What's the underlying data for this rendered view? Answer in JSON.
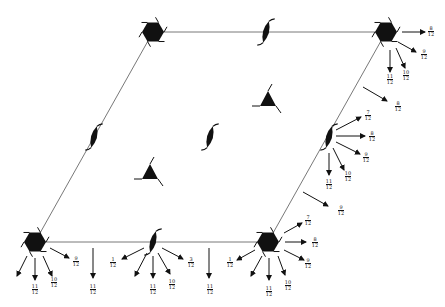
{
  "diagram": {
    "type": "space-group symmetry diagram",
    "cell": {
      "corners": [
        [
          153,
          32
        ],
        [
          386,
          32
        ],
        [
          268,
          242
        ],
        [
          35,
          242
        ]
      ],
      "line_color": "#555555"
    },
    "sixfold_axes": [
      {
        "id": "top-left",
        "x": 153,
        "y": 32
      },
      {
        "id": "top-right",
        "x": 386,
        "y": 32
      },
      {
        "id": "bottom-left",
        "x": 35,
        "y": 242
      },
      {
        "id": "bottom-right",
        "x": 268,
        "y": 242
      }
    ],
    "twofold_axes": [
      {
        "id": "top-edge",
        "x": 266,
        "y": 32
      },
      {
        "id": "left-edge",
        "x": 94,
        "y": 137
      },
      {
        "id": "center",
        "x": 210,
        "y": 137
      },
      {
        "id": "right-edge",
        "x": 329,
        "y": 137
      },
      {
        "id": "bottom-edge",
        "x": 153,
        "y": 242
      }
    ],
    "threefold_axes": [
      {
        "id": "upper",
        "x": 268,
        "y": 100
      },
      {
        "id": "lower",
        "x": 150,
        "y": 173
      }
    ],
    "arrows": [
      {
        "x1": 402,
        "y1": 32,
        "x2": 425,
        "y2": 32,
        "label": {
          "num": "8",
          "den": "12"
        },
        "lx": 431,
        "ly": 32
      },
      {
        "x1": 398,
        "y1": 42,
        "x2": 416,
        "y2": 52,
        "label": {
          "num": "9",
          "den": "12"
        },
        "lx": 424,
        "ly": 55
      },
      {
        "x1": 390,
        "y1": 50,
        "x2": 390,
        "y2": 72,
        "label": {
          "num": "11",
          "den": "12"
        },
        "lx": 390,
        "ly": 80
      },
      {
        "x1": 396,
        "y1": 48,
        "x2": 405,
        "y2": 68,
        "label": {
          "num": "10",
          "den": "12"
        },
        "lx": 406,
        "ly": 76
      },
      {
        "x1": 363,
        "y1": 87,
        "x2": 387,
        "y2": 101,
        "label": {
          "num": "8",
          "den": "12"
        },
        "lx": 398,
        "ly": 107
      },
      {
        "x1": 336,
        "y1": 130,
        "x2": 361,
        "y2": 117,
        "label": {
          "num": "7",
          "den": "12"
        },
        "lx": 368,
        "ly": 116
      },
      {
        "x1": 336,
        "y1": 136,
        "x2": 365,
        "y2": 136,
        "label": {
          "num": "8",
          "den": "12"
        },
        "lx": 372,
        "ly": 137
      },
      {
        "x1": 336,
        "y1": 142,
        "x2": 360,
        "y2": 154,
        "label": {
          "num": "9",
          "den": "12"
        },
        "lx": 366,
        "ly": 158
      },
      {
        "x1": 333,
        "y1": 148,
        "x2": 344,
        "y2": 170,
        "label": {
          "num": "10",
          "den": "12"
        },
        "lx": 348,
        "ly": 177
      },
      {
        "x1": 329,
        "y1": 153,
        "x2": 329,
        "y2": 175,
        "label": {
          "num": "11",
          "den": "12"
        },
        "lx": 329,
        "ly": 185
      },
      {
        "x1": 303,
        "y1": 192,
        "x2": 328,
        "y2": 206,
        "label": {
          "num": "9",
          "den": "12"
        },
        "lx": 341,
        "ly": 211
      },
      {
        "x1": 284,
        "y1": 233,
        "x2": 302,
        "y2": 223,
        "label": {
          "num": "7",
          "den": "12"
        },
        "lx": 308,
        "ly": 221
      },
      {
        "x1": 285,
        "y1": 242,
        "x2": 306,
        "y2": 242,
        "label": {
          "num": "8",
          "den": "12"
        },
        "lx": 315,
        "ly": 243
      },
      {
        "x1": 284,
        "y1": 250,
        "x2": 304,
        "y2": 260,
        "label": {
          "num": "9",
          "den": "12"
        },
        "lx": 308,
        "ly": 264
      },
      {
        "x1": 278,
        "y1": 256,
        "x2": 285,
        "y2": 275,
        "label": {
          "num": "10",
          "den": "12"
        },
        "lx": 288,
        "ly": 286
      },
      {
        "x1": 269,
        "y1": 258,
        "x2": 269,
        "y2": 280,
        "label": {
          "num": "11",
          "den": "12"
        },
        "lx": 269,
        "ly": 292
      },
      {
        "x1": 262,
        "y1": 256,
        "x2": 251,
        "y2": 276,
        "label": null
      },
      {
        "x1": 255,
        "y1": 250,
        "x2": 237,
        "y2": 260,
        "label": {
          "num": "1",
          "den": "12"
        },
        "lx": 230,
        "ly": 263
      },
      {
        "x1": 209,
        "y1": 248,
        "x2": 209,
        "y2": 278,
        "label": {
          "num": "11",
          "den": "12"
        },
        "lx": 210,
        "ly": 290
      },
      {
        "x1": 162,
        "y1": 248,
        "x2": 183,
        "y2": 259,
        "label": {
          "num": "3",
          "den": "12"
        },
        "lx": 191,
        "ly": 263
      },
      {
        "x1": 158,
        "y1": 253,
        "x2": 170,
        "y2": 274,
        "label": {
          "num": "10",
          "den": "12"
        },
        "lx": 172,
        "ly": 285
      },
      {
        "x1": 153,
        "y1": 256,
        "x2": 153,
        "y2": 278,
        "label": {
          "num": "11",
          "den": "12"
        },
        "lx": 153,
        "ly": 290
      },
      {
        "x1": 147,
        "y1": 253,
        "x2": 135,
        "y2": 276,
        "label": null
      },
      {
        "x1": 144,
        "y1": 248,
        "x2": 122,
        "y2": 259,
        "label": {
          "num": "1",
          "den": "12"
        },
        "lx": 113,
        "ly": 263
      },
      {
        "x1": 93,
        "y1": 248,
        "x2": 93,
        "y2": 278,
        "label": {
          "num": "11",
          "den": "12"
        },
        "lx": 93,
        "ly": 290
      },
      {
        "x1": 50,
        "y1": 248,
        "x2": 69,
        "y2": 258,
        "label": {
          "num": "9",
          "den": "12"
        },
        "lx": 76,
        "ly": 262
      },
      {
        "x1": 43,
        "y1": 256,
        "x2": 52,
        "y2": 276,
        "label": {
          "num": "10",
          "den": "12"
        },
        "lx": 54,
        "ly": 283
      },
      {
        "x1": 35,
        "y1": 258,
        "x2": 35,
        "y2": 280,
        "label": {
          "num": "11",
          "den": "12"
        },
        "lx": 35,
        "ly": 290
      },
      {
        "x1": 27,
        "y1": 256,
        "x2": 17,
        "y2": 276,
        "label": null
      }
    ]
  }
}
